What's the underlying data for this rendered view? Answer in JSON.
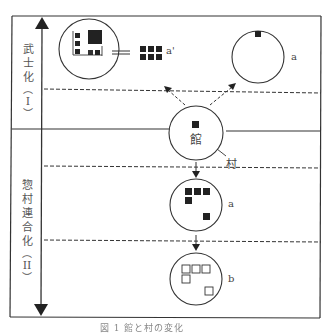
{
  "stages": [
    {
      "id": "I",
      "label_chars": [
        "武",
        "士",
        "化"
      ],
      "numeral": "I"
    },
    {
      "id": "II",
      "label_chars": [
        "惣",
        "村",
        "連",
        "合",
        "化"
      ],
      "numeral": "II"
    }
  ],
  "labels": {
    "center_hall": "館",
    "village": "村",
    "a_prime": "a'",
    "a_top": "a",
    "a_mid": "a",
    "b_bottom": "b",
    "equals": "="
  },
  "caption": "図 1 館と村の変化",
  "colors": {
    "line": "#333333",
    "block": "#222222",
    "background": "#ffffff"
  }
}
